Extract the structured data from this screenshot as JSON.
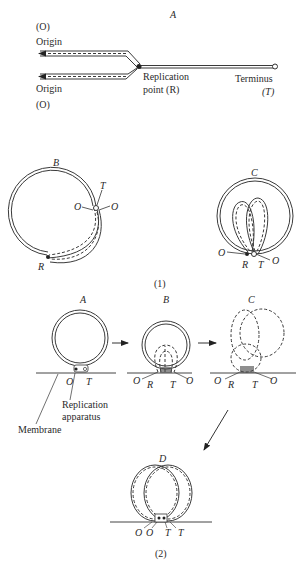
{
  "figure1": {
    "caption": "(1)",
    "panelA": {
      "label": "A",
      "origin_top_symbol": "(O)",
      "origin_top_label": "Origin",
      "origin_bottom_label": "Origin",
      "origin_bottom_symbol": "(O)",
      "replication_line1": "Replication",
      "replication_line2": "point (R)",
      "terminus_label": "Terminus",
      "terminus_symbol": "(T)"
    },
    "panelB": {
      "label": "B",
      "T": "T",
      "O_left": "O",
      "O_right": "O",
      "R": "R"
    },
    "panelC": {
      "label": "C",
      "O_left": "O",
      "R": "R",
      "T": "T",
      "O_right": "O"
    }
  },
  "figure2": {
    "caption": "(2)",
    "panelA": {
      "label": "A",
      "O": "O",
      "T": "T",
      "apparatus_line1": "Replication",
      "apparatus_line2": "apparatus",
      "membrane": "Membrane"
    },
    "panelB": {
      "label": "B",
      "O_left": "O",
      "R": "R",
      "T": "T",
      "O_right": "O"
    },
    "panelC": {
      "label": "C",
      "O_left": "O",
      "R": "R",
      "T": "T",
      "O_right": "O"
    },
    "panelD": {
      "label": "D",
      "O1": "O",
      "O2": "O",
      "T1": "T",
      "T2": "T"
    }
  }
}
